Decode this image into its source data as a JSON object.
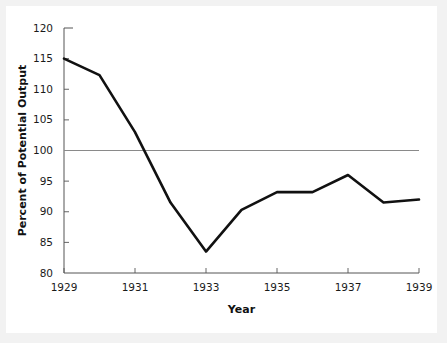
{
  "figure": {
    "background_color": "#ffffff",
    "page_background_color": "#f2f2f2",
    "line_color": "#111111",
    "reference_line_color": "#8a8a8a",
    "axis_color": "#555555"
  },
  "axes": {
    "x_title": "Year",
    "y_title": "Percent of Potential Output",
    "x_tick_labels": [
      "1929",
      "1931",
      "1933",
      "1935",
      "1937",
      "1939"
    ],
    "y_tick_labels": [
      "80",
      "85",
      "90",
      "95",
      "100",
      "105",
      "110",
      "115",
      "120"
    ]
  },
  "chart_data": {
    "type": "line",
    "title": "",
    "xlabel": "Year",
    "ylabel": "Percent of Potential Output",
    "xlim": [
      1929,
      1939
    ],
    "ylim": [
      80,
      120
    ],
    "grid": false,
    "legend": "none",
    "x": [
      1929,
      1930,
      1931,
      1932,
      1933,
      1934,
      1935,
      1936,
      1937,
      1938,
      1939
    ],
    "values": [
      115.0,
      112.3,
      103.0,
      91.5,
      83.5,
      90.3,
      93.2,
      93.2,
      96.0,
      91.5,
      92.0
    ],
    "x_ticks": [
      1929,
      1931,
      1933,
      1935,
      1937,
      1939
    ],
    "y_ticks": [
      80,
      85,
      90,
      95,
      100,
      105,
      110,
      115,
      120
    ],
    "annotations": [
      {
        "name": "reference-line",
        "type": "hline",
        "y": 100,
        "label": "100"
      }
    ],
    "series": [
      {
        "name": "Percent of Potential Output",
        "values": [
          115.0,
          112.3,
          103.0,
          91.5,
          83.5,
          90.3,
          93.2,
          93.2,
          96.0,
          91.5,
          92.0
        ]
      }
    ]
  }
}
